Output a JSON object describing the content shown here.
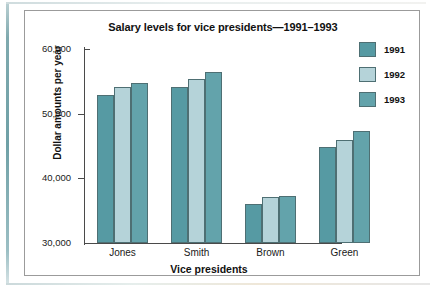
{
  "chart_data": {
    "type": "bar",
    "title": "Salary levels for vice presidents—1991–1993",
    "xlabel": "Vice presidents",
    "ylabel": "Dollar amounts per year",
    "categories": [
      "Jones",
      "Smith",
      "Brown",
      "Green"
    ],
    "series": [
      {
        "name": "1991",
        "color": "#569aa3",
        "values": [
          52900,
          54200,
          36000,
          44800
        ]
      },
      {
        "name": "1992",
        "color": "#b5d3d9",
        "values": [
          54200,
          55400,
          37100,
          46000
        ]
      },
      {
        "name": "1993",
        "color": "#63a3ab",
        "values": [
          54800,
          56400,
          37300,
          47300
        ]
      }
    ],
    "ylim": [
      30000,
      60000
    ],
    "yticks": [
      30000,
      40000,
      50000,
      60000
    ],
    "ytick_labels": [
      "30,000",
      "40,000",
      "50,000",
      "60,000"
    ],
    "grid": false,
    "legend_position": "right"
  },
  "panel": {
    "border_color": "#9b9b9b",
    "background": "#ffffff"
  },
  "accents": {
    "left_rule": "#6fa0a6",
    "axis": "#4a4a4a",
    "bar_outline": "#4e6f73"
  }
}
